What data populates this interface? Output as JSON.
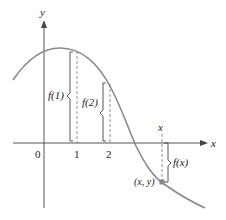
{
  "figure": {
    "axes": {
      "x_label": "x",
      "y_label": "y",
      "origin_label": "0",
      "tick_labels": [
        "1",
        "2"
      ]
    },
    "annotations": {
      "f1_label": "f(1)",
      "f2_label": "f(2)",
      "fx_label": "f(x)",
      "point_label": "(x, y)",
      "x_marker_label": "x"
    },
    "colors": {
      "curve": "#8a8a8a",
      "axes": "#555555",
      "point": "#888888",
      "text": "#222222"
    }
  }
}
